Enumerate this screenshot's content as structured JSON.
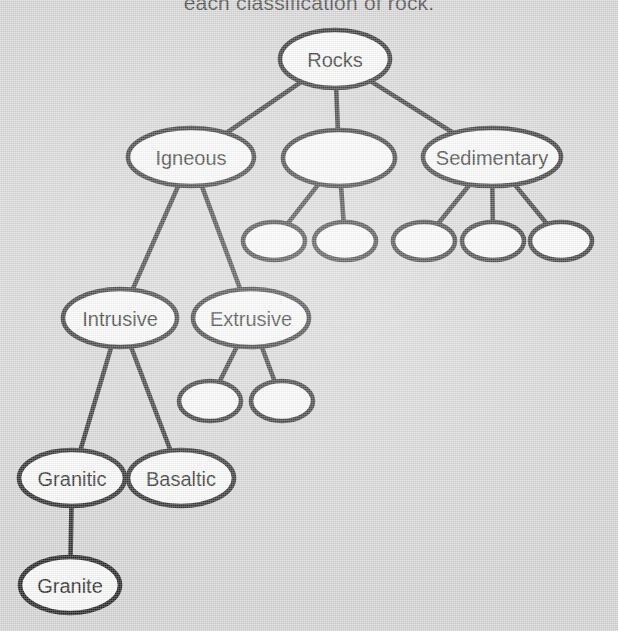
{
  "document": {
    "header_text": "each classification of rock.",
    "title": "Rock Classification Concept Map",
    "background_color": "#d2d2d2",
    "node_fill_color": "#fbfbfb",
    "node_stroke_color": "#0d0d0d",
    "edge_color": "#111111"
  },
  "chart_data": {
    "type": "diagram",
    "diagram_kind": "concept-map-tree",
    "nodes": [
      {
        "id": "rocks",
        "label": "Rocks",
        "level": 0,
        "cx": 335,
        "cy": 59,
        "rx": 55,
        "ry": 29,
        "empty": false
      },
      {
        "id": "igneous",
        "label": "Igneous",
        "level": 1,
        "cx": 191,
        "cy": 157,
        "rx": 63,
        "ry": 29,
        "empty": false
      },
      {
        "id": "blank-mid",
        "label": "",
        "level": 1,
        "cx": 339,
        "cy": 158,
        "rx": 56,
        "ry": 28,
        "empty": true
      },
      {
        "id": "sedimentary",
        "label": "Sedimentary",
        "level": 1,
        "cx": 492,
        "cy": 157,
        "rx": 69,
        "ry": 29,
        "empty": false
      },
      {
        "id": "blank-m1",
        "label": "",
        "level": 2,
        "cx": 274,
        "cy": 241,
        "rx": 31,
        "ry": 19,
        "empty": true
      },
      {
        "id": "blank-m2",
        "label": "",
        "level": 2,
        "cx": 345,
        "cy": 241,
        "rx": 31,
        "ry": 19,
        "empty": true
      },
      {
        "id": "blank-s1",
        "label": "",
        "level": 2,
        "cx": 424,
        "cy": 241,
        "rx": 31,
        "ry": 19,
        "empty": true
      },
      {
        "id": "blank-s2",
        "label": "",
        "level": 2,
        "cx": 493,
        "cy": 241,
        "rx": 31,
        "ry": 19,
        "empty": true
      },
      {
        "id": "blank-s3",
        "label": "",
        "level": 2,
        "cx": 561,
        "cy": 241,
        "rx": 31,
        "ry": 19,
        "empty": true
      },
      {
        "id": "intrusive",
        "label": "Intrusive",
        "level": 2,
        "cx": 120,
        "cy": 318,
        "rx": 57,
        "ry": 29,
        "empty": false
      },
      {
        "id": "extrusive",
        "label": "Extrusive",
        "level": 2,
        "cx": 251,
        "cy": 318,
        "rx": 58,
        "ry": 29,
        "empty": false
      },
      {
        "id": "blank-e1",
        "label": "",
        "level": 3,
        "cx": 210,
        "cy": 401,
        "rx": 31,
        "ry": 20,
        "empty": true
      },
      {
        "id": "blank-e2",
        "label": "",
        "level": 3,
        "cx": 282,
        "cy": 401,
        "rx": 31,
        "ry": 20,
        "empty": true
      },
      {
        "id": "granitic",
        "label": "Granitic",
        "level": 3,
        "cx": 72,
        "cy": 478,
        "rx": 53,
        "ry": 28,
        "empty": false
      },
      {
        "id": "basaltic",
        "label": "Basaltic",
        "level": 3,
        "cx": 181,
        "cy": 478,
        "rx": 53,
        "ry": 28,
        "empty": false
      },
      {
        "id": "granite",
        "label": "Granite",
        "level": 4,
        "cx": 70,
        "cy": 585,
        "rx": 50,
        "ry": 28,
        "empty": false
      }
    ],
    "edges": [
      {
        "from": "rocks",
        "to": "igneous"
      },
      {
        "from": "rocks",
        "to": "blank-mid"
      },
      {
        "from": "rocks",
        "to": "sedimentary"
      },
      {
        "from": "blank-mid",
        "to": "blank-m1"
      },
      {
        "from": "blank-mid",
        "to": "blank-m2"
      },
      {
        "from": "sedimentary",
        "to": "blank-s1"
      },
      {
        "from": "sedimentary",
        "to": "blank-s2"
      },
      {
        "from": "sedimentary",
        "to": "blank-s3"
      },
      {
        "from": "igneous",
        "to": "intrusive"
      },
      {
        "from": "igneous",
        "to": "extrusive"
      },
      {
        "from": "extrusive",
        "to": "blank-e1"
      },
      {
        "from": "extrusive",
        "to": "blank-e2"
      },
      {
        "from": "intrusive",
        "to": "granitic"
      },
      {
        "from": "intrusive",
        "to": "basaltic"
      },
      {
        "from": "granitic",
        "to": "granite"
      }
    ],
    "labels_present": [
      "Rocks",
      "Igneous",
      "Sedimentary",
      "Intrusive",
      "Extrusive",
      "Granitic",
      "Basaltic",
      "Granite"
    ],
    "blank_node_count": 8
  }
}
